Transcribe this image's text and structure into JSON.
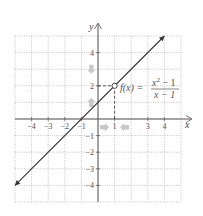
{
  "chart_data": {
    "type": "line",
    "title": "",
    "xlabel": "x",
    "ylabel": "y",
    "xlim": [
      -5,
      5
    ],
    "ylim": [
      -5,
      5
    ],
    "grid": true,
    "grid_style": "dotted",
    "x_ticks": [
      -4,
      -3,
      -2,
      -1,
      1,
      3,
      4
    ],
    "x_tick_labels": [
      "−4",
      "−3",
      "−2",
      "−1",
      "1",
      "3",
      "4"
    ],
    "y_ticks": [
      4,
      2,
      -1,
      -2,
      -3,
      -4
    ],
    "y_tick_labels": [
      "4",
      "2",
      "−1",
      "−2",
      "−3",
      "−4"
    ],
    "series": [
      {
        "name": "f(x) = (x² − 1)/(x − 1)",
        "equation_equivalent": "y = x + 1, x ≠ 1",
        "x": [
          -5,
          4
        ],
        "y": [
          -4,
          5
        ],
        "color": "#333333",
        "arrows_both_ends": true
      }
    ],
    "annotations": [
      {
        "type": "open-circle",
        "x": 1,
        "y": 2,
        "label": "hole at (1, 2)"
      },
      {
        "type": "dashed-line",
        "from": [
          0,
          2
        ],
        "to": [
          1,
          2
        ]
      },
      {
        "type": "dashed-line",
        "from": [
          1,
          2
        ],
        "to": [
          1,
          0
        ]
      },
      {
        "type": "arrow",
        "direction": "down",
        "at": [
          -0.4,
          3
        ],
        "color": "#c8c8c8"
      },
      {
        "type": "arrow",
        "direction": "up",
        "at": [
          -0.4,
          1
        ],
        "color": "#c8c8c8"
      },
      {
        "type": "arrow",
        "direction": "right",
        "at": [
          0.4,
          -0.5
        ],
        "color": "#c8c8c8"
      },
      {
        "type": "arrow",
        "direction": "left",
        "at": [
          1.6,
          -0.5
        ],
        "color": "#c8c8c8"
      }
    ],
    "function_label": {
      "lhs": "f(x) =",
      "numerator": "x² − 1",
      "denominator": "x − 1"
    }
  },
  "labels": {
    "x_axis": "x",
    "y_axis": "y",
    "func_lhs": "f(x) =",
    "func_num_base": "x",
    "func_num_exp": "2",
    "func_num_rest": " − 1",
    "func_den": "x − 1"
  },
  "colors": {
    "line": "#333333",
    "axis": "#555555",
    "grid": "#aaaaaa",
    "hint_arrows": "#c8c8c8"
  }
}
